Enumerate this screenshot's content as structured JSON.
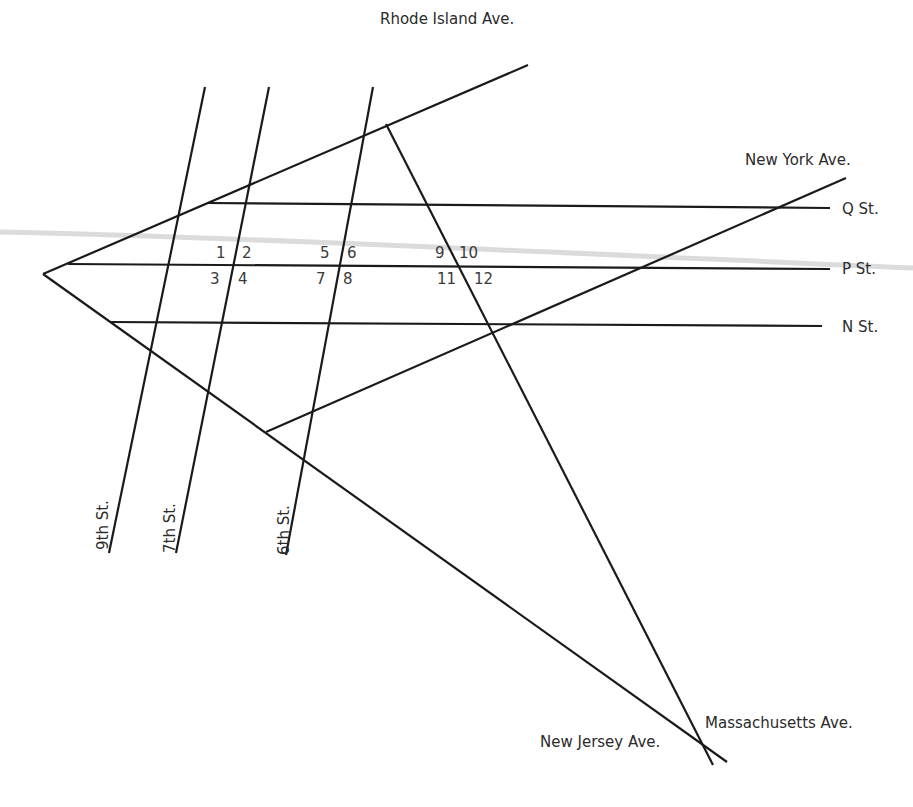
{
  "diagram": {
    "type": "street-map",
    "roads": {
      "rhode_island": "Rhode Island Ave.",
      "new_york": "New York Ave.",
      "q_st": "Q St.",
      "p_st": "P St.",
      "n_st": "N St.",
      "ninth_st": "9th St.",
      "seventh_st": "7th St.",
      "sixth_st": "6th St.",
      "new_jersey": "New Jersey Ave.",
      "massachusetts": "Massachusetts Ave."
    },
    "angle_labels": {
      "a1": "1",
      "a2": "2",
      "a3": "3",
      "a4": "4",
      "a5": "5",
      "a6": "6",
      "a7": "7",
      "a8": "8",
      "a9": "9",
      "a10": "10",
      "a11": "11",
      "a12": "12"
    },
    "colors": {
      "line": "#1a1a1a",
      "text": "#2b2b2b",
      "background": "#ffffff"
    }
  }
}
